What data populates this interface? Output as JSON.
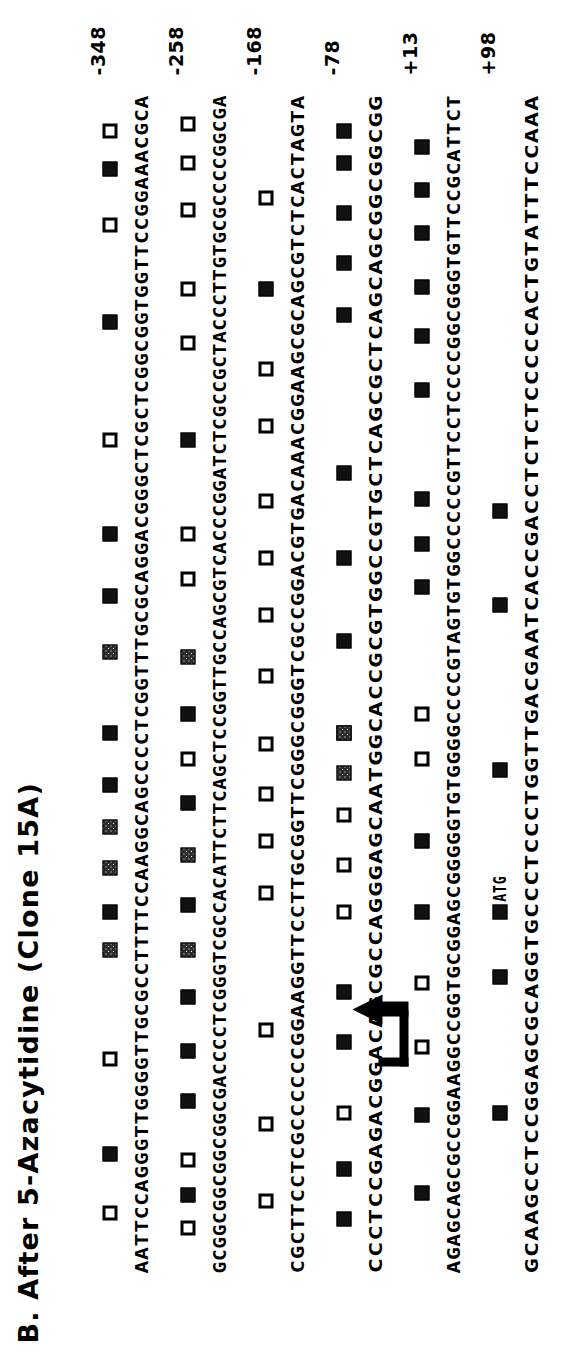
{
  "figure": {
    "panel_letter": "B.",
    "title": "B.  After 5-Azacytidine  (Clone 15A)",
    "type": "bisulfite-methylation-map",
    "orientation": "rotated-90-ccw",
    "legend": {
      "filled_square_meaning": "methylated CpG",
      "open_square_meaning": "unmethylated CpG",
      "partial_square_meaning": "partially methylated CpG"
    },
    "colors": {
      "ink": "#000000",
      "background": "#ffffff",
      "filled_marker": "#111111",
      "open_marker": "#ffffff"
    }
  },
  "annotations": {
    "tss_arrow_name": "transcription-start-site-arrow",
    "atg_label": "ATG"
  },
  "rows": [
    {
      "position_label": "-348",
      "sequence": "AATTCCAGGGTTGGGGTTGCGCCTTTTCCAAGGCAGCCCCTCGGTTTGCGCAGGACGGGCTCGCTCGGCGGTGGTTCCGGAAACGCA",
      "markers": [
        {
          "type": "open",
          "at": 0.045
        },
        {
          "type": "filled",
          "at": 0.095
        },
        {
          "type": "open",
          "at": 0.175
        },
        {
          "type": "partial",
          "at": 0.268
        },
        {
          "type": "filled",
          "at": 0.3
        },
        {
          "type": "partial",
          "at": 0.337
        },
        {
          "type": "partial",
          "at": 0.372
        },
        {
          "type": "filled",
          "at": 0.408
        },
        {
          "type": "filled",
          "at": 0.452
        },
        {
          "type": "partial",
          "at": 0.52
        },
        {
          "type": "filled",
          "at": 0.568
        },
        {
          "type": "filled",
          "at": 0.62
        },
        {
          "type": "open",
          "at": 0.7
        },
        {
          "type": "filled",
          "at": 0.8
        },
        {
          "type": "open",
          "at": 0.882
        },
        {
          "type": "filled",
          "at": 0.93
        },
        {
          "type": "open",
          "at": 0.962
        }
      ]
    },
    {
      "position_label": "-258",
      "sequence": "GCGGCGGCGGCGGCGACCCCTCGGGTCGCCACATTCTTCAGCTCCGGTTGCCAGCGTCACCCGGATCTCGCCGCTACCCTTGTGCGCCCCGGCGA",
      "markers": [
        {
          "type": "open",
          "at": 0.032
        },
        {
          "type": "filled",
          "at": 0.06
        },
        {
          "type": "open",
          "at": 0.09
        },
        {
          "type": "filled",
          "at": 0.14
        },
        {
          "type": "filled",
          "at": 0.182
        },
        {
          "type": "filled",
          "at": 0.228
        },
        {
          "type": "partial",
          "at": 0.268
        },
        {
          "type": "filled",
          "at": 0.306
        },
        {
          "type": "partial",
          "at": 0.348
        },
        {
          "type": "filled",
          "at": 0.392
        },
        {
          "type": "open",
          "at": 0.43
        },
        {
          "type": "filled",
          "at": 0.468
        },
        {
          "type": "partial",
          "at": 0.516
        },
        {
          "type": "open",
          "at": 0.582
        },
        {
          "type": "open",
          "at": 0.62
        },
        {
          "type": "filled",
          "at": 0.7
        },
        {
          "type": "open",
          "at": 0.782
        },
        {
          "type": "open",
          "at": 0.828
        },
        {
          "type": "open",
          "at": 0.895
        },
        {
          "type": "open",
          "at": 0.935
        },
        {
          "type": "open",
          "at": 0.968
        }
      ]
    },
    {
      "position_label": "-168",
      "sequence": "CGCTTCCTCGCCCCCCGGAAGGTTCCTTGCGGTTCGGGCGGGTCGCCGGACGTGACAAACGGAAGCGCAGCGTCTCACTAGTA",
      "markers": [
        {
          "type": "open",
          "at": 0.055
        },
        {
          "type": "open",
          "at": 0.12
        },
        {
          "type": "open",
          "at": 0.2
        },
        {
          "type": "open",
          "at": 0.316
        },
        {
          "type": "open",
          "at": 0.36
        },
        {
          "type": "open",
          "at": 0.4
        },
        {
          "type": "open",
          "at": 0.442
        },
        {
          "type": "open",
          "at": 0.5
        },
        {
          "type": "open",
          "at": 0.552
        },
        {
          "type": "open",
          "at": 0.6
        },
        {
          "type": "open",
          "at": 0.648
        },
        {
          "type": "open",
          "at": 0.712
        },
        {
          "type": "open",
          "at": 0.76
        },
        {
          "type": "filled",
          "at": 0.828
        },
        {
          "type": "open",
          "at": 0.905
        }
      ]
    },
    {
      "position_label": "-78",
      "sequence": "CCCTCCGAGACGGACAGCGCCAGGGAGCAATGGCACCGCGTGGCCGTGCTCAGCGCTCAGCAGCGGCGGCGG",
      "markers": [
        {
          "type": "filled",
          "at": 0.04
        },
        {
          "type": "filled",
          "at": 0.082
        },
        {
          "type": "open",
          "at": 0.13
        },
        {
          "type": "filled",
          "at": 0.19
        },
        {
          "type": "filled",
          "at": 0.232
        },
        {
          "type": "open",
          "at": 0.3
        },
        {
          "type": "open",
          "at": 0.34
        },
        {
          "type": "open",
          "at": 0.382
        },
        {
          "type": "partial",
          "at": 0.418
        },
        {
          "type": "filled",
          "at": 0.452
        },
        {
          "type": "partial",
          "at": 0.452
        },
        {
          "type": "filled",
          "at": 0.53
        },
        {
          "type": "filled",
          "at": 0.6
        },
        {
          "type": "filled",
          "at": 0.672
        },
        {
          "type": "filled",
          "at": 0.806
        },
        {
          "type": "filled",
          "at": 0.85
        },
        {
          "type": "filled",
          "at": 0.892
        },
        {
          "type": "filled",
          "at": 0.935
        },
        {
          "type": "filled",
          "at": 0.962
        }
      ]
    },
    {
      "position_label": "+13",
      "sequence": "AGAGCAGCGCCGGAAGGCCGGTGCGGAGCGGGGGTGTGGGGCCCCGTAGTGTGGCCCCCGTTCCTCCCCGGCGGGTGTTCCGCATTCT",
      "markers": [
        {
          "type": "filled",
          "at": 0.062
        },
        {
          "type": "filled",
          "at": 0.128
        },
        {
          "type": "open",
          "at": 0.186
        },
        {
          "type": "open",
          "at": 0.24
        },
        {
          "type": "filled",
          "at": 0.3
        },
        {
          "type": "filled",
          "at": 0.36
        },
        {
          "type": "open",
          "at": 0.43
        },
        {
          "type": "open",
          "at": 0.468
        },
        {
          "type": "filled",
          "at": 0.575
        },
        {
          "type": "filled",
          "at": 0.612
        },
        {
          "type": "filled",
          "at": 0.65
        },
        {
          "type": "filled",
          "at": 0.742
        },
        {
          "type": "filled",
          "at": 0.788
        },
        {
          "type": "filled",
          "at": 0.83
        },
        {
          "type": "filled",
          "at": 0.875
        },
        {
          "type": "filled",
          "at": 0.912
        },
        {
          "type": "filled",
          "at": 0.948
        }
      ]
    },
    {
      "position_label": "+98",
      "sequence": "GCAAGCCTCCGGAGCGCAGGTGCCCTCCCTGGTTGACGAATCACCGACCTCTCTCCCCCACTGTATTTCCAAA",
      "markers": [
        {
          "type": "filled",
          "at": 0.13
        },
        {
          "type": "filled",
          "at": 0.245
        },
        {
          "type": "filled",
          "at": 0.3
        },
        {
          "type": "filled",
          "at": 0.42
        },
        {
          "type": "filled",
          "at": 0.56
        },
        {
          "type": "filled",
          "at": 0.64
        }
      ]
    }
  ]
}
